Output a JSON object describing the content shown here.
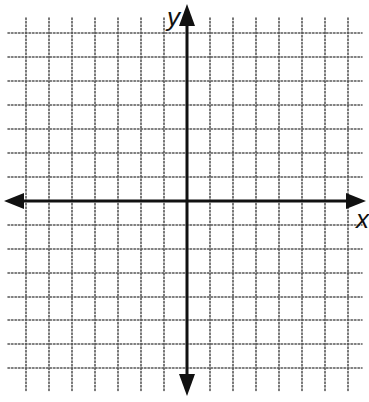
{
  "diagram": {
    "type": "coordinate-plane",
    "grid": {
      "style": "dotted",
      "color": "#555555",
      "vertical_lines_x": [
        26,
        49,
        72,
        95,
        118,
        141,
        164,
        210,
        233,
        256,
        279,
        302,
        325,
        348
      ],
      "horizontal_lines_y": [
        33,
        57,
        81,
        105,
        129,
        153,
        177,
        225,
        249,
        273,
        297,
        320,
        344,
        368
      ],
      "extent": {
        "x0": 8,
        "x1": 362,
        "y0": 18,
        "y1": 392
      }
    },
    "axes": {
      "color": "#111111",
      "x_axis": {
        "label": "x",
        "y": 201,
        "x0": 4,
        "x1": 366
      },
      "y_axis": {
        "label": "y",
        "x": 187,
        "y0": 4,
        "y1": 396
      }
    }
  }
}
